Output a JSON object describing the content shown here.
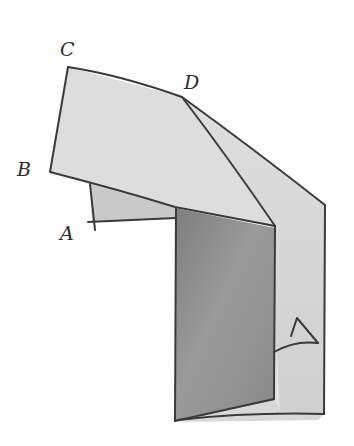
{
  "figure": {
    "labels": {
      "c": "C",
      "d": "D",
      "b": "B",
      "a": "A"
    },
    "angle_mark": "angle-marker-triangle",
    "colors": {
      "background": "#ffffff",
      "pencil_line": "#3a3a3a",
      "top_panel": "#dcdcdc",
      "small_flap": "#c8c8c8",
      "front_panel_dark": "#8f8f8f",
      "back_strip": "#d6d6d6",
      "fold_face": "#e2e2e2"
    }
  }
}
